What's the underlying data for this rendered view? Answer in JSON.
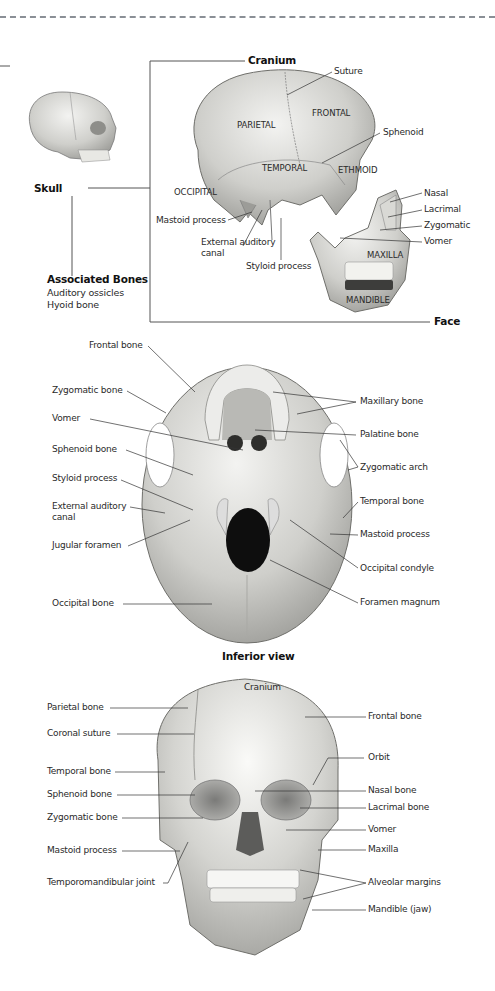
{
  "lateral_section": {
    "skull_label": "Skull",
    "cranium_label": "Cranium",
    "face_label": "Face",
    "associated": {
      "title": "Associated Bones",
      "items": [
        "Auditory ossicles",
        "Hyoid bone"
      ]
    },
    "cranial_bones": [
      "PARIETAL",
      "FRONTAL",
      "TEMPORAL",
      "ETHMOID",
      "OCCIPITAL"
    ],
    "callouts": {
      "suture": "Suture",
      "sphenoid": "Sphenoid",
      "mastoid": "Mastoid process",
      "external_auditory_1": "External auditory",
      "external_auditory_2": "canal",
      "styloid": "Styloid process"
    },
    "facial_bones": {
      "nasal": "Nasal",
      "lacrimal": "Lacrimal",
      "zygomatic": "Zygomatic",
      "vomer": "Vomer",
      "maxilla": "MAXILLA",
      "mandible": "MANDIBLE"
    }
  },
  "inferior_view": {
    "caption": "Inferior view",
    "left_labels": [
      "Frontal bone",
      "Zygomatic bone",
      "Vomer",
      "Sphenoid bone",
      "Styloid process",
      "External auditory",
      "canal",
      "Jugular foramen",
      "Occipital bone"
    ],
    "right_labels": [
      "Maxillary bone",
      "Palatine bone",
      "Zygomatic arch",
      "Temporal bone",
      "Mastoid process",
      "Occipital condyle",
      "Foramen magnum"
    ]
  },
  "anterior_view": {
    "cranium_label": "Cranium",
    "left_labels": [
      "Parietal bone",
      "Coronal suture",
      "Temporal bone",
      "Sphenoid bone",
      "Zygomatic bone",
      "Mastoid process",
      "Temporomandibular joint"
    ],
    "right_labels": [
      "Frontal bone",
      "Orbit",
      "Nasal bone",
      "Lacrimal bone",
      "Vomer",
      "Maxilla",
      "Alveolar margins",
      "Mandible (jaw)"
    ]
  },
  "colors": {
    "bone_light": "#e6e6e3",
    "bone_mid": "#bdbdb9",
    "bone_dark": "#8e8e8a",
    "leader_line": "#333333",
    "bracket": "#555555",
    "dashed_rule": "#8a8f96"
  }
}
